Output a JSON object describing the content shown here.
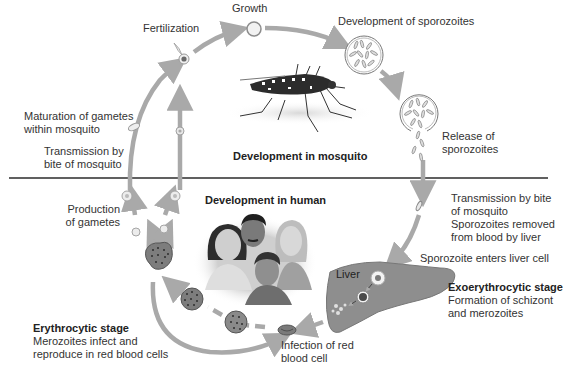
{
  "diagram": {
    "colors": {
      "arrow": "#a9a9a9",
      "divider": "#2b2b2b",
      "cell_fill": "#e6e6e6",
      "cell_stroke": "#9a9a9a",
      "infected_rbc": "#7d7d7d",
      "rbc_dots": "#2e2e2e",
      "liver": "#8e8e8e",
      "text": "#333333"
    },
    "sections": {
      "mosquito": {
        "heading": "Development in mosquito"
      },
      "human": {
        "heading": "Development in human"
      }
    },
    "labels": {
      "growth": "Growth",
      "fertilization": "Fertilization",
      "development_sporozoites": "Development of sporozoites",
      "release_line1": "Release of",
      "release_line2": "sporozoites",
      "maturation_line1": "Maturation of gametes",
      "maturation_line2": "within mosquito",
      "transmission_left_line1": "Transmission by",
      "transmission_left_line2": "bite of mosquito",
      "production_line1": "Production",
      "production_line2": "of gametes",
      "transmission_right_line1": "Transmission by bite",
      "transmission_right_line2": "of mosquito",
      "removed_line1": "Sporozoites removed",
      "removed_line2": "from blood by liver",
      "enters_liver": "Sporozoite enters liver cell",
      "liver": "Liver",
      "exo_heading": "Exoerythrocytic stage",
      "exo_line1": "Formation of schizont",
      "exo_line2": "and merozoites",
      "infection_line1": "Infection of red",
      "infection_line2": "blood cell",
      "erythro_heading": "Erythrocytic stage",
      "erythro_line1": "Merozoites infect and",
      "erythro_line2": "reproduce in red blood cells"
    },
    "illustrations": {
      "mosquito": "mosquito-illustration",
      "humans": "group-of-people-illustration"
    }
  }
}
